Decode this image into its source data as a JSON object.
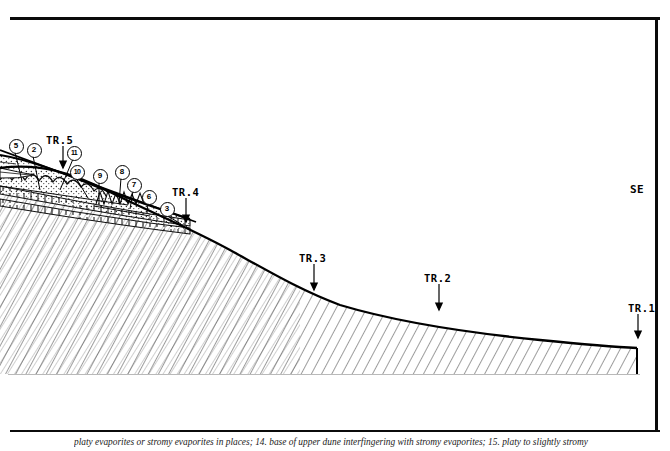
{
  "figure": {
    "type": "geological-cross-section",
    "direction_label": "SE",
    "caption": "platy evaporites or stromy evaporites in places; 14. base of upper dune interfingering with stromy evaporites; 15. platy to slightly stromy"
  },
  "trenches": [
    {
      "label": "TR.5",
      "x": 46,
      "y": 134,
      "arrow_x": 63,
      "arrow_from": 146,
      "arrow_to": 168
    },
    {
      "label": "TR.4",
      "x": 172,
      "y": 186,
      "arrow_x": 186,
      "arrow_from": 198,
      "arrow_to": 222
    },
    {
      "label": "TR.3",
      "x": 299,
      "y": 252,
      "arrow_x": 314,
      "arrow_from": 264,
      "arrow_to": 290
    },
    {
      "label": "TR.2",
      "x": 424,
      "y": 272,
      "arrow_x": 439,
      "arrow_from": 284,
      "arrow_to": 310
    },
    {
      "label": "TR.1",
      "x": 628,
      "y": 302,
      "arrow_x": 638,
      "arrow_from": 314,
      "arrow_to": 338
    }
  ],
  "key_numbers": [
    {
      "label": "5",
      "cx": 15,
      "cy": 145,
      "leader_x": 22,
      "leader_y": 181
    },
    {
      "label": "2",
      "cx": 33,
      "cy": 149,
      "leader_x": 40,
      "leader_y": 190
    },
    {
      "label": "11",
      "cx": 73,
      "cy": 152,
      "leader_x": 60,
      "leader_y": 190
    },
    {
      "label": "10",
      "cx": 76,
      "cy": 171,
      "leader_x": 88,
      "leader_y": 198
    },
    {
      "label": "9",
      "cx": 99,
      "cy": 175,
      "leader_x": 99,
      "leader_y": 205
    },
    {
      "label": "8",
      "cx": 121,
      "cy": 171,
      "leader_x": 119,
      "leader_y": 204
    },
    {
      "label": "7",
      "cx": 133,
      "cy": 184,
      "leader_x": 130,
      "leader_y": 209
    },
    {
      "label": "6",
      "cx": 148,
      "cy": 196,
      "leader_x": 147,
      "leader_y": 213
    },
    {
      "label": "3",
      "cx": 166,
      "cy": 208,
      "leader_x": 181,
      "leader_y": 224
    }
  ],
  "chart_data": {
    "type": "line",
    "title": "",
    "xlabel": "",
    "ylabel": "",
    "grid": false,
    "legend": "none",
    "series": [
      {
        "name": "topographic-profile",
        "points": [
          [
            0,
            168
          ],
          [
            40,
            163
          ],
          [
            80,
            178
          ],
          [
            120,
            196
          ],
          [
            160,
            214
          ],
          [
            200,
            232
          ],
          [
            240,
            258
          ],
          [
            280,
            282
          ],
          [
            320,
            300
          ],
          [
            360,
            310
          ],
          [
            400,
            318
          ],
          [
            440,
            325
          ],
          [
            480,
            331
          ],
          [
            520,
            336
          ],
          [
            560,
            341
          ],
          [
            600,
            345
          ],
          [
            637,
            348
          ]
        ]
      },
      {
        "name": "upper-dune-surface",
        "points": [
          [
            0,
            155
          ],
          [
            40,
            166
          ],
          [
            80,
            181
          ],
          [
            120,
            195
          ],
          [
            160,
            208
          ],
          [
            190,
            219
          ]
        ]
      },
      {
        "name": "evaporite-bed-upper",
        "points": [
          [
            0,
            188
          ],
          [
            50,
            198
          ],
          [
            100,
            208
          ],
          [
            150,
            216
          ],
          [
            190,
            222
          ]
        ]
      },
      {
        "name": "evaporite-bed-lower",
        "points": [
          [
            0,
            200
          ],
          [
            50,
            209
          ],
          [
            100,
            217
          ],
          [
            150,
            224
          ],
          [
            190,
            229
          ]
        ]
      }
    ]
  }
}
